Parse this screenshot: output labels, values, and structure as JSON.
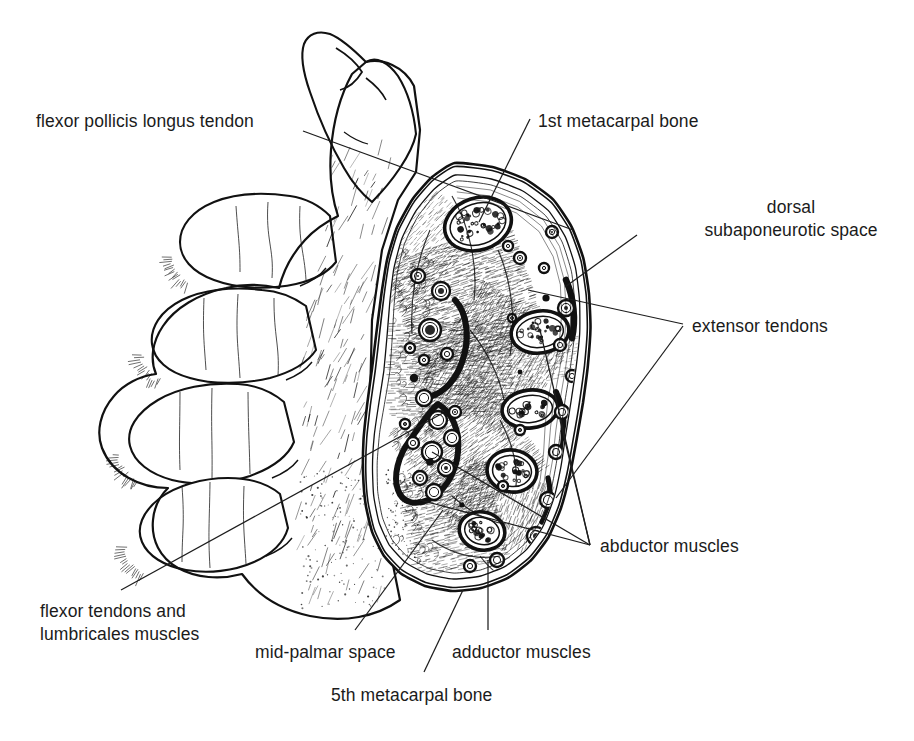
{
  "figure": {
    "kind": "anatomical-line-illustration",
    "ink_color": "#111111",
    "background_color": "#ffffff",
    "text_color": "#1b1b1b"
  },
  "labels": {
    "flexor_pollicis_longus": "flexor pollicis longus tendon",
    "first_metacarpal": "1st metacarpal bone",
    "dorsal_subaponeurotic_line1": "dorsal",
    "dorsal_subaponeurotic_line2": "subaponeurotic space",
    "extensor_tendons": "extensor tendons",
    "abductor_muscles": "abductor muscles",
    "flexor_tendons_line1": "flexor tendons and",
    "flexor_tendons_line2": "lumbricales muscles",
    "mid_palmar_space": "mid-palmar space",
    "adductor_muscles": "adductor muscles",
    "fifth_metacarpal": "5th metacarpal bone"
  },
  "label_positions": {
    "flexor_pollicis_longus": {
      "x": 36,
      "y": 110,
      "align": "left"
    },
    "first_metacarpal": {
      "x": 538,
      "y": 110,
      "align": "left"
    },
    "dorsal_subaponeurotic": {
      "x": 592,
      "y": 196,
      "align": "right",
      "right_edge": 906
    },
    "extensor_tendons": {
      "x": 692,
      "y": 315,
      "align": "left"
    },
    "abductor_muscles": {
      "x": 600,
      "y": 535,
      "align": "left"
    },
    "flexor_tendons": {
      "x": 40,
      "y": 600,
      "align": "left"
    },
    "mid_palmar_space": {
      "x": 255,
      "y": 641,
      "align": "left"
    },
    "adductor_muscles": {
      "x": 452,
      "y": 641,
      "align": "left"
    },
    "fifth_metacarpal": {
      "x": 331,
      "y": 684,
      "align": "left"
    }
  },
  "leader_lines": [
    {
      "name": "flexor-pollicis-longus-leader",
      "points": [
        [
          303,
          131
        ],
        [
          573,
          230
        ]
      ]
    },
    {
      "name": "first-metacarpal-leader",
      "points": [
        [
          530,
          119
        ],
        [
          479,
          222
        ]
      ]
    },
    {
      "name": "dorsal-subaponeurotic-leader",
      "points": [
        [
          637,
          235
        ],
        [
          565,
          287
        ]
      ]
    },
    {
      "name": "extensor-tendons-leader-upper",
      "points": [
        [
          683,
          324
        ],
        [
          528,
          290
        ]
      ]
    },
    {
      "name": "extensor-tendons-leader-lower",
      "points": [
        [
          683,
          326
        ],
        [
          556,
          498
        ]
      ]
    },
    {
      "name": "abductor-muscles-leader-a",
      "points": [
        [
          590,
          545
        ],
        [
          540,
          330
        ]
      ]
    },
    {
      "name": "abductor-muscles-leader-b",
      "points": [
        [
          590,
          545
        ],
        [
          560,
          420
        ]
      ]
    },
    {
      "name": "abductor-muscles-leader-c",
      "points": [
        [
          590,
          545
        ],
        [
          432,
          452
        ]
      ]
    },
    {
      "name": "abductor-muscles-leader-d",
      "points": [
        [
          590,
          545
        ],
        [
          420,
          500
        ]
      ]
    },
    {
      "name": "flexor-tendons-leader",
      "points": [
        [
          121,
          590
        ],
        [
          443,
          413
        ]
      ]
    },
    {
      "name": "mid-palmar-space-leader",
      "points": [
        [
          355,
          630
        ],
        [
          443,
          510
        ]
      ]
    },
    {
      "name": "adductor-muscles-leader",
      "points": [
        [
          488,
          630
        ],
        [
          488,
          560
        ]
      ]
    },
    {
      "name": "fifth-metacarpal-leader",
      "points": [
        [
          424,
          672
        ],
        [
          463,
          590
        ]
      ]
    }
  ],
  "anatomy_structures": {
    "bones": [
      {
        "name": "1st metacarpal bone",
        "cx": 478,
        "cy": 224,
        "rx": 34,
        "ry": 26,
        "rotate": -18
      },
      {
        "name": "2nd metacarpal bone",
        "cx": 540,
        "cy": 332,
        "rx": 29,
        "ry": 21,
        "rotate": -8
      },
      {
        "name": "3rd metacarpal bone",
        "cx": 530,
        "cy": 409,
        "rx": 28,
        "ry": 19,
        "rotate": -6
      },
      {
        "name": "4th metacarpal bone",
        "cx": 512,
        "cy": 471,
        "rx": 25,
        "ry": 21,
        "rotate": 8
      },
      {
        "name": "5th metacarpal bone",
        "cx": 482,
        "cy": 531,
        "rx": 23,
        "ry": 19,
        "rotate": 14
      }
    ],
    "tendon_sheaths": [
      {
        "name": "flexor tendon sheath upper",
        "note": "thick black arc, palmar side"
      },
      {
        "name": "flexor tendon sheath lower",
        "note": "thick black loop enclosing tendon profiles"
      }
    ],
    "spaces": [
      {
        "name": "mid-palmar space"
      },
      {
        "name": "dorsal subaponeurotic space"
      }
    ],
    "muscle_groups": [
      {
        "name": "thenar / abductor muscles"
      },
      {
        "name": "adductor muscles"
      },
      {
        "name": "interosseous muscles"
      },
      {
        "name": "lumbricales muscles"
      }
    ]
  },
  "hand": {
    "description": "left hand, palm toward viewer, fingers extended to the left, thumb up",
    "digits": [
      "thumb",
      "index finger",
      "middle finger",
      "ring finger",
      "little finger"
    ]
  }
}
